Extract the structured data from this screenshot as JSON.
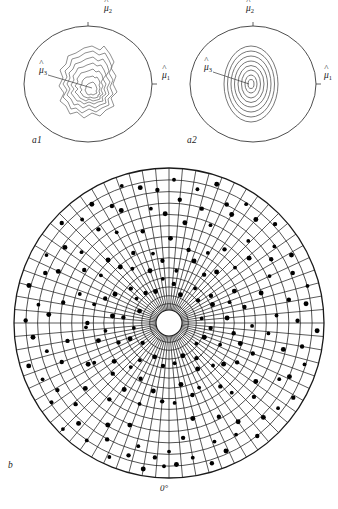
{
  "figure": {
    "type": "stereographic-projection-figure",
    "background_color": "#ffffff",
    "line_color": "#1a1a1a",
    "contour_color": "#555555",
    "point_color": "#000000"
  },
  "panels": [
    {
      "id": "a1",
      "tag": "a1",
      "kind": "contour-plot-empirical",
      "description": "Irregular empirical density contours inside a circular boundary",
      "contour_levels": 7,
      "axis_labels": [
        {
          "name": "mu-hat-1",
          "symbol": "μ",
          "hat": true,
          "subscript": "1",
          "position": "right"
        },
        {
          "name": "mu-hat-2",
          "symbol": "μ",
          "hat": true,
          "subscript": "2",
          "position": "top"
        },
        {
          "name": "mu-hat-3",
          "symbol": "μ",
          "hat": true,
          "subscript": "3",
          "position": "center-left-leader"
        }
      ]
    },
    {
      "id": "a2",
      "tag": "a2",
      "kind": "contour-plot-theoretical",
      "description": "Smooth concentric elliptical contours inside a circular boundary",
      "contour_levels": 8,
      "axis_labels": [
        {
          "name": "mu-hat-1",
          "symbol": "μ",
          "hat": true,
          "subscript": "1",
          "position": "right"
        },
        {
          "name": "mu-hat-2",
          "symbol": "μ",
          "hat": true,
          "subscript": "2",
          "position": "top"
        },
        {
          "name": "mu-hat-3",
          "symbol": "μ",
          "hat": true,
          "subscript": "3",
          "position": "center-left-leader"
        }
      ]
    },
    {
      "id": "b",
      "tag": "b",
      "kind": "polar-scatter-net",
      "description": "Large polar net (radial spokes plus concentric circles) with scattered data points",
      "radial_spokes": 72,
      "concentric_circles": 14,
      "origin_label": "0°",
      "point_count": 228
    }
  ],
  "labels": {
    "mu_symbol": "μ",
    "sub_1": "1",
    "sub_2": "2",
    "sub_3": "3",
    "tag_a1": "a1",
    "tag_a2": "a2",
    "tag_b": "b",
    "zero_degrees": "0°"
  },
  "chart_data": {
    "type": "scatter",
    "title": "",
    "xlabel": "",
    "ylabel": "",
    "projection": "polar",
    "grid": true,
    "legend": null,
    "angle_reference_label": "0°",
    "angle_reference_deg": 180,
    "radial_range": [
      0,
      1
    ],
    "panel_a1_contours": [
      0.12,
      0.25,
      0.38,
      0.5,
      0.62,
      0.75,
      0.9
    ],
    "panel_a2_contours": [
      0.1,
      0.2,
      0.3,
      0.42,
      0.54,
      0.66,
      0.8,
      0.95
    ],
    "points_polar_deg_r": [
      [
        182,
        0.93
      ],
      [
        186,
        0.88
      ],
      [
        190,
        0.96
      ],
      [
        194,
        0.83
      ],
      [
        197,
        0.9
      ],
      [
        201,
        0.72
      ],
      [
        204,
        0.95
      ],
      [
        208,
        0.86
      ],
      [
        211,
        0.78
      ],
      [
        215,
        0.93
      ],
      [
        218,
        0.64
      ],
      [
        222,
        0.88
      ],
      [
        225,
        0.97
      ],
      [
        229,
        0.81
      ],
      [
        232,
        0.7
      ],
      [
        236,
        0.92
      ],
      [
        239,
        0.85
      ],
      [
        243,
        0.6
      ],
      [
        246,
        0.9
      ],
      [
        250,
        0.75
      ],
      [
        253,
        0.95
      ],
      [
        257,
        0.82
      ],
      [
        260,
        0.68
      ],
      [
        264,
        0.89
      ],
      [
        267,
        0.55
      ],
      [
        271,
        0.93
      ],
      [
        274,
        0.79
      ],
      [
        278,
        0.86
      ],
      [
        281,
        0.71
      ],
      [
        285,
        0.94
      ],
      [
        288,
        0.62
      ],
      [
        292,
        0.87
      ],
      [
        295,
        0.8
      ],
      [
        299,
        0.91
      ],
      [
        302,
        0.66
      ],
      [
        306,
        0.84
      ],
      [
        309,
        0.74
      ],
      [
        313,
        0.95
      ],
      [
        316,
        0.58
      ],
      [
        320,
        0.88
      ],
      [
        323,
        0.77
      ],
      [
        327,
        0.92
      ],
      [
        330,
        0.69
      ],
      [
        334,
        0.85
      ],
      [
        337,
        0.8
      ],
      [
        341,
        0.94
      ],
      [
        344,
        0.63
      ],
      [
        348,
        0.9
      ],
      [
        351,
        0.76
      ],
      [
        355,
        0.87
      ],
      [
        358,
        0.72
      ],
      [
        2,
        0.93
      ],
      [
        5,
        0.81
      ],
      [
        9,
        0.67
      ],
      [
        12,
        0.89
      ],
      [
        16,
        0.78
      ],
      [
        19,
        0.95
      ],
      [
        23,
        0.7
      ],
      [
        26,
        0.86
      ],
      [
        30,
        0.82
      ],
      [
        33,
        0.92
      ],
      [
        37,
        0.61
      ],
      [
        40,
        0.88
      ],
      [
        44,
        0.75
      ],
      [
        47,
        0.94
      ],
      [
        51,
        0.68
      ],
      [
        54,
        0.85
      ],
      [
        58,
        0.79
      ],
      [
        61,
        0.91
      ],
      [
        65,
        0.73
      ],
      [
        68,
        0.87
      ],
      [
        72,
        0.64
      ],
      [
        75,
        0.93
      ],
      [
        79,
        0.8
      ],
      [
        82,
        0.9
      ],
      [
        86,
        0.71
      ],
      [
        89,
        0.84
      ],
      [
        93,
        0.96
      ],
      [
        96,
        0.66
      ],
      [
        100,
        0.88
      ],
      [
        103,
        0.77
      ],
      [
        107,
        0.92
      ],
      [
        110,
        0.59
      ],
      [
        114,
        0.86
      ],
      [
        117,
        0.81
      ],
      [
        121,
        0.94
      ],
      [
        124,
        0.69
      ],
      [
        128,
        0.9
      ],
      [
        131,
        0.74
      ],
      [
        135,
        0.87
      ],
      [
        138,
        0.62
      ],
      [
        142,
        0.93
      ],
      [
        145,
        0.79
      ],
      [
        149,
        0.85
      ],
      [
        152,
        0.7
      ],
      [
        156,
        0.91
      ],
      [
        159,
        0.83
      ],
      [
        163,
        0.95
      ],
      [
        166,
        0.65
      ],
      [
        170,
        0.89
      ],
      [
        173,
        0.76
      ],
      [
        177,
        0.92
      ],
      [
        180,
        0.84
      ],
      [
        185,
        0.52
      ],
      [
        193,
        0.46
      ],
      [
        200,
        0.57
      ],
      [
        207,
        0.41
      ],
      [
        214,
        0.53
      ],
      [
        221,
        0.38
      ],
      [
        228,
        0.5
      ],
      [
        235,
        0.44
      ],
      [
        242,
        0.56
      ],
      [
        249,
        0.35
      ],
      [
        256,
        0.48
      ],
      [
        263,
        0.42
      ],
      [
        270,
        0.54
      ],
      [
        277,
        0.37
      ],
      [
        284,
        0.51
      ],
      [
        291,
        0.45
      ],
      [
        298,
        0.4
      ],
      [
        305,
        0.55
      ],
      [
        312,
        0.33
      ],
      [
        319,
        0.49
      ],
      [
        326,
        0.43
      ],
      [
        333,
        0.52
      ],
      [
        340,
        0.36
      ],
      [
        347,
        0.47
      ],
      [
        354,
        0.41
      ],
      [
        1,
        0.56
      ],
      [
        8,
        0.34
      ],
      [
        15,
        0.5
      ],
      [
        22,
        0.44
      ],
      [
        29,
        0.53
      ],
      [
        36,
        0.39
      ],
      [
        43,
        0.46
      ],
      [
        50,
        0.57
      ],
      [
        57,
        0.32
      ],
      [
        64,
        0.48
      ],
      [
        71,
        0.42
      ],
      [
        78,
        0.51
      ],
      [
        85,
        0.38
      ],
      [
        92,
        0.55
      ],
      [
        99,
        0.43
      ],
      [
        106,
        0.49
      ],
      [
        113,
        0.36
      ],
      [
        120,
        0.52
      ],
      [
        127,
        0.45
      ],
      [
        134,
        0.4
      ],
      [
        141,
        0.54
      ],
      [
        148,
        0.35
      ],
      [
        155,
        0.47
      ],
      [
        162,
        0.5
      ],
      [
        169,
        0.41
      ],
      [
        176,
        0.53
      ],
      [
        188,
        0.27
      ],
      [
        203,
        0.22
      ],
      [
        218,
        0.3
      ],
      [
        233,
        0.19
      ],
      [
        248,
        0.26
      ],
      [
        262,
        0.21
      ],
      [
        277,
        0.29
      ],
      [
        292,
        0.18
      ],
      [
        307,
        0.25
      ],
      [
        322,
        0.23
      ],
      [
        337,
        0.2
      ],
      [
        352,
        0.28
      ],
      [
        7,
        0.24
      ],
      [
        22,
        0.17
      ],
      [
        37,
        0.27
      ],
      [
        52,
        0.22
      ],
      [
        67,
        0.3
      ],
      [
        82,
        0.19
      ],
      [
        97,
        0.26
      ],
      [
        112,
        0.23
      ],
      [
        127,
        0.2
      ],
      [
        142,
        0.28
      ],
      [
        157,
        0.21
      ],
      [
        172,
        0.25
      ]
    ]
  }
}
